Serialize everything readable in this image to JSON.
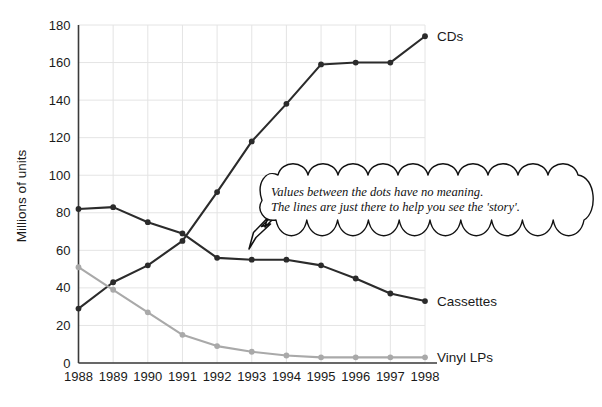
{
  "chart_data": {
    "type": "line",
    "title": "",
    "xlabel": "",
    "ylabel": "Millions of units",
    "categories": [
      "1988",
      "1989",
      "1990",
      "1991",
      "1992",
      "1993",
      "1994",
      "1995",
      "1996",
      "1997",
      "1998"
    ],
    "ylim": [
      0,
      180
    ],
    "ytick_step": 20,
    "yticks": [
      "0",
      "20",
      "40",
      "60",
      "80",
      "100",
      "120",
      "140",
      "160",
      "180"
    ],
    "grid": "both",
    "legend": "inline-right-of-line-end",
    "series": [
      {
        "name": "CDs",
        "color": "#2b2b2b",
        "values": [
          29,
          43,
          52,
          65,
          91,
          118,
          138,
          159,
          160,
          160,
          174
        ]
      },
      {
        "name": "Cassettes",
        "color": "#2b2b2b",
        "values": [
          82,
          83,
          75,
          69,
          56,
          55,
          55,
          52,
          45,
          37,
          33
        ]
      },
      {
        "name": "Vinyl LPs",
        "color": "#a9a9a9",
        "values": [
          51,
          39,
          27,
          15,
          9,
          6,
          4,
          3,
          3,
          3,
          3
        ]
      }
    ],
    "annotations": [
      {
        "name": "callout-bubble",
        "shape": "cloud",
        "line1": "Values between the dots have no meaning.",
        "line2": "The lines are just there to help you see the 'story'.",
        "pointer": "outlined-arrow-down-left",
        "points_to": "Cassettes 1993"
      }
    ],
    "colors": {
      "axis": "#333333",
      "grid": "#e2e2e2",
      "dark_series": "#2b2b2b",
      "light_series": "#a9a9a9",
      "text": "#1a1a1a",
      "background": "#ffffff"
    }
  }
}
